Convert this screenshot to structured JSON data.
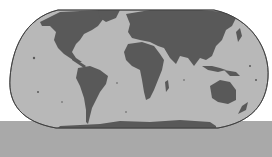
{
  "map": {
    "type": "world-map",
    "projection": "robinson-like",
    "style": "grayscale",
    "colors": {
      "background": "#ffffff",
      "ocean": "#b8b8b8",
      "land": "#595959",
      "outline": "#3a3a3a",
      "bottom_bar": "#a9a9a9"
    },
    "regions": [
      "North America",
      "South America",
      "Europe",
      "Africa",
      "Asia",
      "Australia",
      "Antarctica"
    ]
  }
}
